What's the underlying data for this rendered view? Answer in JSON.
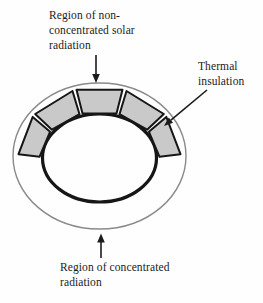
{
  "diagram": {
    "labels": {
      "non_concentrated": {
        "lines": [
          "Region of non-",
          "concentrated solar",
          "radiation"
        ]
      },
      "thermal": {
        "lines": [
          "Thermal",
          "insulation"
        ]
      },
      "concentrated": {
        "lines": [
          "Region of concentrated",
          "radiation"
        ]
      }
    },
    "segments": {
      "count": 5
    },
    "colors": {
      "segment_fill": "#c9c9c9",
      "segment_stroke": "#161616",
      "inner_ring_stroke": "#161616",
      "outer_shell_stroke": "#8a8a8a",
      "arrow": "#1b1b1b",
      "text": "#1b1b1b",
      "background": "#fefefe"
    }
  }
}
